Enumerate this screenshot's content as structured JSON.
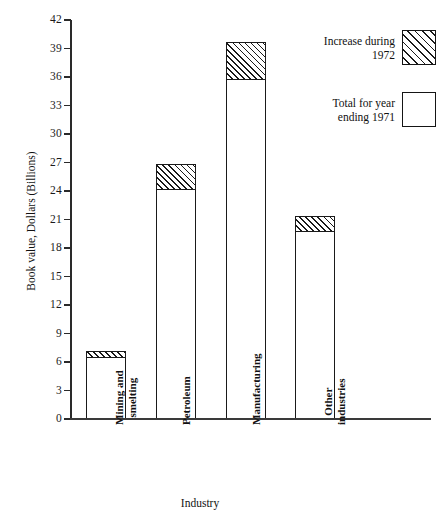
{
  "chart_data": {
    "type": "bar",
    "title": "",
    "subtitle": "",
    "xlabel": "Industry",
    "ylabel": "Book value, Dollars (Billions)",
    "categories": [
      "Mining and\nsmelting",
      "Petroleum",
      "Manufacturing",
      "Other\nindustries"
    ],
    "ylim": [
      0,
      42
    ],
    "yticks": [
      0,
      3,
      6,
      9,
      12,
      15,
      18,
      21,
      24,
      27,
      30,
      33,
      36,
      39,
      42
    ],
    "ytick_labels": [
      "0",
      "3",
      "6",
      "9",
      "12",
      "15",
      "18",
      "21",
      "24",
      "27",
      "30",
      "33",
      "36",
      "39",
      "42"
    ],
    "grid": false,
    "stacked": true,
    "legend_position": "top-right",
    "series": [
      {
        "name": "Total for year ending 1971",
        "fill": "solid-white",
        "values": [
          6.6,
          24.3,
          35.8,
          19.8
        ]
      },
      {
        "name": "Increase during 1972",
        "fill": "hatched",
        "values": [
          0.6,
          2.5,
          3.9,
          1.6
        ]
      }
    ],
    "totals": [
      7.2,
      26.8,
      39.7,
      21.4
    ],
    "annotations": []
  },
  "legend": {
    "items": [
      {
        "label": "Increase during\n1972",
        "swatch": "hatched"
      },
      {
        "label": "Total for year\nending 1971",
        "swatch": "empty"
      }
    ]
  },
  "colors": {
    "axis": "#2a2a2a",
    "bar_outline": "#1a1a1a",
    "bar_fill": "#ffffff",
    "hatch": "#1a1a1a",
    "background": "#ffffff",
    "text": "#111111"
  }
}
